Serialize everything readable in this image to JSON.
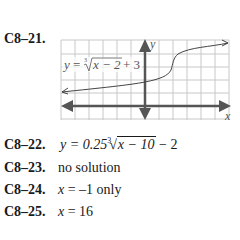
{
  "problems": [
    {
      "id": "C8-21",
      "label": "C8–21.",
      "graph": {
        "equation_label": "y = ∛(x − 2) + 3",
        "eq_y": "y",
        "eq_eq": "=",
        "eq_index": "3",
        "eq_radicand": "x − 2",
        "eq_tail": "+ 3",
        "x_axis_label": "x",
        "y_axis_label": "y",
        "grid_columns": 12,
        "grid_rows": 6
      }
    },
    {
      "id": "C8-22",
      "label": "C8–22.",
      "answer_prefix": "y = 0.25",
      "root_index": "3",
      "radicand": "x − 10",
      "answer_suffix": "− 2"
    },
    {
      "id": "C8-23",
      "label": "C8–23.",
      "answer": "no solution"
    },
    {
      "id": "C8-24",
      "label": "C8–24.",
      "answer_var": "x",
      "answer_rest": "= –1 only"
    },
    {
      "id": "C8-25",
      "label": "C8–25.",
      "answer_var": "x",
      "answer_rest": "= 16"
    }
  ],
  "colors": {
    "text": "#1a1a1a",
    "grid": "#c8c8c8",
    "axis": "#555555",
    "curve": "#444444"
  }
}
